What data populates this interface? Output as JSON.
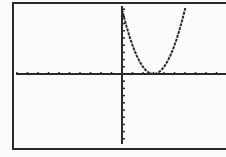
{
  "chart_data": {
    "type": "line",
    "title": "",
    "xlabel": "",
    "ylabel": "",
    "function": "y = (x - 3)^2",
    "xlim": [
      -10,
      10
    ],
    "ylim": [
      -10,
      10
    ],
    "x_tick_spacing": 1,
    "y_tick_spacing": 1,
    "grid": false,
    "legend": false,
    "series": [
      {
        "name": "Y1",
        "x": [
          0,
          1,
          2,
          3,
          4,
          5,
          6
        ],
        "y": [
          9,
          4,
          1,
          0,
          1,
          4,
          9
        ]
      }
    ],
    "vertex": [
      3,
      0
    ]
  },
  "colors": {
    "ink": "#2a2a2a",
    "background": "#fbfbfb",
    "frame": "#2a2a2a"
  }
}
